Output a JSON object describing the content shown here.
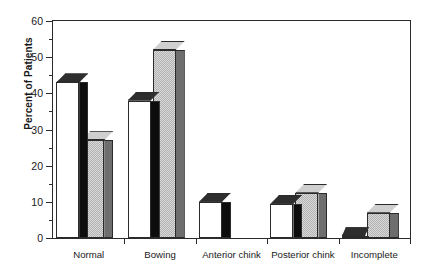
{
  "chart_data": {
    "type": "bar",
    "title": "",
    "subtitle": "",
    "xlabel": "",
    "ylabel": "Percent of Patients",
    "categories": [
      "Normal",
      "Bowing",
      "Anterior chink",
      "Posterior chink",
      "Incomplete"
    ],
    "series": [
      {
        "name": "white",
        "values": [
          43,
          38,
          10,
          9.5,
          0.5
        ]
      },
      {
        "name": "gray",
        "values": [
          27,
          52,
          0,
          12.5,
          7
        ]
      }
    ],
    "ylim": [
      0,
      60
    ],
    "ytick_labels": [
      "0",
      "10",
      "20",
      "30",
      "40",
      "50",
      "60"
    ],
    "ytick_values": [
      0,
      10,
      20,
      30,
      40,
      50,
      60
    ],
    "yminor_values": [
      5,
      15,
      25,
      35,
      45,
      55
    ],
    "grid": false,
    "legend": "none",
    "style": "3d-bars",
    "colors": {
      "white_bar_face": "#ffffff",
      "white_bar_side": "#0d0d0d",
      "white_bar_top": "#2e2e2e",
      "gray_bar_face": "#b2b2b2",
      "gray_bar_side": "#6e6e6e",
      "gray_bar_top": "#cfcfcf",
      "axis": "#2b2b2b",
      "text": "#1a1a1a",
      "background": "#ffffff"
    }
  }
}
